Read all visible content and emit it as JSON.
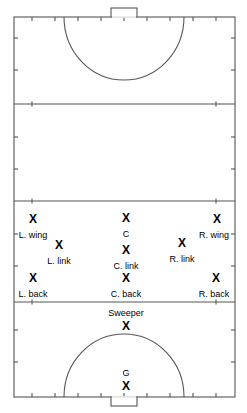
{
  "diagram": {
    "type": "field-hockey-formation-diagram",
    "orientation": "vertical",
    "field": {
      "outline_color": "#555555",
      "background_color": "#ffffff",
      "line_color": "#555555",
      "left": 14,
      "top": 17,
      "right": 235,
      "bottom": 397,
      "horizontal_lines_y": [
        104,
        201,
        302
      ],
      "tick_marks_x": [
        32,
        55,
        78,
        101,
        124,
        147,
        170,
        193,
        216
      ],
      "tick_marks_y": [
        38,
        70,
        137,
        169,
        234,
        266,
        330,
        362
      ]
    },
    "goals": [
      {
        "name": "top-goal",
        "x_center": 124,
        "width": 26,
        "depth": 9,
        "side": "top"
      },
      {
        "name": "bottom-goal",
        "x_center": 124,
        "width": 26,
        "depth": 9,
        "side": "bottom"
      }
    ],
    "shooting_circles": [
      {
        "name": "top-shooting-circle",
        "cx": 124,
        "cy": 17,
        "rx": 60,
        "ry": 63,
        "side": "top"
      },
      {
        "name": "bottom-shooting-circle",
        "cx": 124,
        "cy": 397,
        "rx": 60,
        "ry": 63,
        "side": "bottom"
      }
    ],
    "marker_glyph": "X"
  },
  "players": [
    {
      "id": "l-wing",
      "label": "L. wing",
      "marker": "X",
      "x": 33,
      "y": 219,
      "label_x": 33,
      "label_y": 235
    },
    {
      "id": "center",
      "label": "C",
      "marker": "X",
      "x": 126,
      "y": 218,
      "label_x": 126,
      "label_y": 234
    },
    {
      "id": "r-wing",
      "label": "R. wing",
      "marker": "X",
      "x": 217,
      "y": 219,
      "label_x": 214,
      "label_y": 235
    },
    {
      "id": "l-link",
      "label": "L. link",
      "marker": "X",
      "x": 59,
      "y": 245,
      "label_x": 59,
      "label_y": 261
    },
    {
      "id": "c-link",
      "label": "C. link",
      "marker": "X",
      "x": 126,
      "y": 250,
      "label_x": 126,
      "label_y": 266
    },
    {
      "id": "r-link",
      "label": "R. link",
      "marker": "X",
      "x": 182,
      "y": 243,
      "label_x": 182,
      "label_y": 259
    },
    {
      "id": "l-back",
      "label": "L. back",
      "marker": "X",
      "x": 33,
      "y": 278,
      "label_x": 33,
      "label_y": 294
    },
    {
      "id": "c-back",
      "label": "C. back",
      "marker": "X",
      "x": 126,
      "y": 278,
      "label_x": 126,
      "label_y": 294
    },
    {
      "id": "r-back",
      "label": "R. back",
      "marker": "X",
      "x": 216,
      "y": 278,
      "label_x": 214,
      "label_y": 294
    },
    {
      "id": "sweeper",
      "label": "Sweeper",
      "marker": "X",
      "x": 126,
      "y": 326,
      "label_x": 126,
      "label_y": 313
    },
    {
      "id": "goalie",
      "label": "G",
      "marker": "X",
      "x": 126,
      "y": 386,
      "label_x": 126,
      "label_y": 373
    }
  ]
}
